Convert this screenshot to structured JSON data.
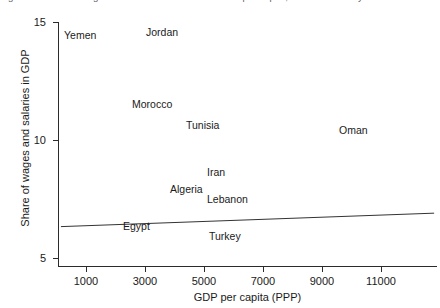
{
  "figure": {
    "clipped_title": "Figure 3. Share of wages and salaries in GDP and GDP per capita, latest available year"
  },
  "chart_data": {
    "type": "scatter",
    "title": "",
    "xlabel": "GDP per capita (PPP)",
    "ylabel": "Share of wages and salaries in GDP",
    "xlim": [
      0,
      12600
    ],
    "ylim": [
      4.3,
      15.6
    ],
    "grid": false,
    "legend": null,
    "xticks": [
      1000,
      3000,
      5000,
      7000,
      9000,
      11000
    ],
    "xtick_labels": [
      "1000",
      "3000",
      "5000",
      "7000",
      "9000",
      "11000"
    ],
    "yticks": [
      5,
      10,
      15
    ],
    "ytick_labels": [
      "5",
      "10",
      "15"
    ],
    "point_labels_only": true,
    "points": [
      {
        "label": "Yemen",
        "x": 800,
        "y": 14.5
      },
      {
        "label": "Jordan",
        "x": 3000,
        "y": 14.7
      },
      {
        "label": "Morocco",
        "x": 2400,
        "y": 11.6
      },
      {
        "label": "Tunisia",
        "x": 4200,
        "y": 10.7
      },
      {
        "label": "Oman",
        "x": 9500,
        "y": 10.5
      },
      {
        "label": "Iran",
        "x": 5300,
        "y": 8.6
      },
      {
        "label": "Algeria",
        "x": 4000,
        "y": 7.9
      },
      {
        "label": "Lebanon",
        "x": 5500,
        "y": 7.5
      },
      {
        "label": "Egypt",
        "x": 2200,
        "y": 6.3
      },
      {
        "label": "Turkey",
        "x": 5500,
        "y": 5.9
      }
    ],
    "trendline": {
      "type": "linear",
      "x_start": 150,
      "y_start": 6.33,
      "x_end": 12800,
      "y_end": 6.9,
      "color": "#333333"
    },
    "colors": {
      "axis": "#2b2b2b",
      "text": "#1a1a1a",
      "trendline": "#333333",
      "background": "#ffffff"
    }
  }
}
